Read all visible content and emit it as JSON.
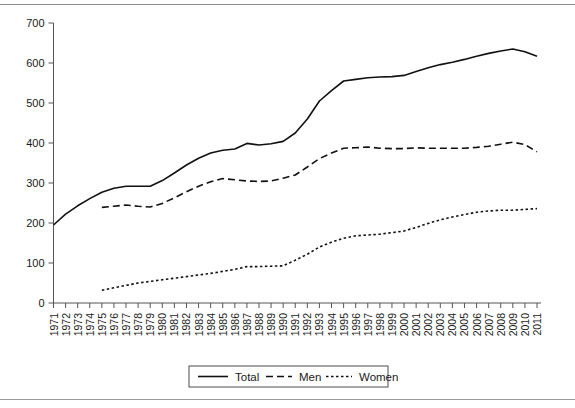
{
  "chart_data": {
    "type": "line",
    "title": "",
    "subtitle": "",
    "xlabel": "",
    "ylabel": "",
    "ylim": [
      0,
      700
    ],
    "yticks": [
      0,
      100,
      200,
      300,
      400,
      500,
      600,
      700
    ],
    "ytick_labels": [
      "0",
      "100",
      "200",
      "300",
      "400",
      "500",
      "600",
      "700"
    ],
    "grid": false,
    "legend_position": "bottom-center",
    "x": [
      1971,
      1972,
      1973,
      1974,
      1975,
      1976,
      1977,
      1978,
      1979,
      1980,
      1981,
      1982,
      1983,
      1984,
      1985,
      1986,
      1987,
      1988,
      1989,
      1990,
      1991,
      1992,
      1993,
      1994,
      1995,
      1996,
      1997,
      1998,
      1999,
      2000,
      2001,
      2002,
      2003,
      2004,
      2005,
      2006,
      2007,
      2008,
      2009,
      2010,
      2011
    ],
    "xtick_labels": [
      "1971",
      "1972",
      "1973",
      "1974",
      "1975",
      "1976",
      "1977",
      "1978",
      "1979",
      "1980",
      "1981",
      "1982",
      "1983",
      "1984",
      "1985",
      "1986",
      "1987",
      "1988",
      "1989",
      "1990",
      "1991",
      "1992",
      "1993",
      "1994",
      "1995",
      "1996",
      "1997",
      "1998",
      "1999",
      "2000",
      "2001",
      "2002",
      "2003",
      "2004",
      "2005",
      "2006",
      "2007",
      "2008",
      "2009",
      "2010",
      "2011"
    ],
    "series": [
      {
        "name": "Total",
        "style": "solid",
        "values": [
          195,
          222,
          243,
          261,
          277,
          287,
          292,
          292,
          292,
          306,
          325,
          345,
          362,
          375,
          382,
          385,
          399,
          395,
          398,
          404,
          425,
          460,
          505,
          531,
          555,
          559,
          563,
          565,
          566,
          569,
          579,
          588,
          596,
          602,
          609,
          617,
          624,
          630,
          635,
          628,
          617
        ]
      },
      {
        "name": "Men",
        "style": "dashed",
        "values": [
          null,
          null,
          null,
          null,
          239,
          242,
          245,
          242,
          240,
          249,
          263,
          278,
          292,
          303,
          311,
          308,
          305,
          304,
          305,
          312,
          320,
          340,
          361,
          375,
          387,
          388,
          390,
          387,
          386,
          386,
          388,
          387,
          387,
          387,
          387,
          389,
          392,
          397,
          402,
          396,
          378
        ]
      },
      {
        "name": "Women",
        "style": "dotted",
        "values": [
          null,
          null,
          null,
          null,
          32,
          38,
          44,
          50,
          54,
          58,
          62,
          66,
          70,
          74,
          79,
          84,
          91,
          91,
          92,
          93,
          107,
          122,
          140,
          152,
          162,
          168,
          170,
          172,
          176,
          180,
          189,
          199,
          208,
          215,
          221,
          227,
          230,
          232,
          232,
          234,
          236
        ]
      }
    ],
    "legend": [
      {
        "label": "Total",
        "style": "solid"
      },
      {
        "label": "Men",
        "style": "dashed"
      },
      {
        "label": "Women",
        "style": "dotted"
      }
    ],
    "colors": {
      "series": "#111111",
      "axis": "#555555",
      "text": "#1a1a1a",
      "background": "#ffffff",
      "rule": "#8a8a8a"
    }
  }
}
